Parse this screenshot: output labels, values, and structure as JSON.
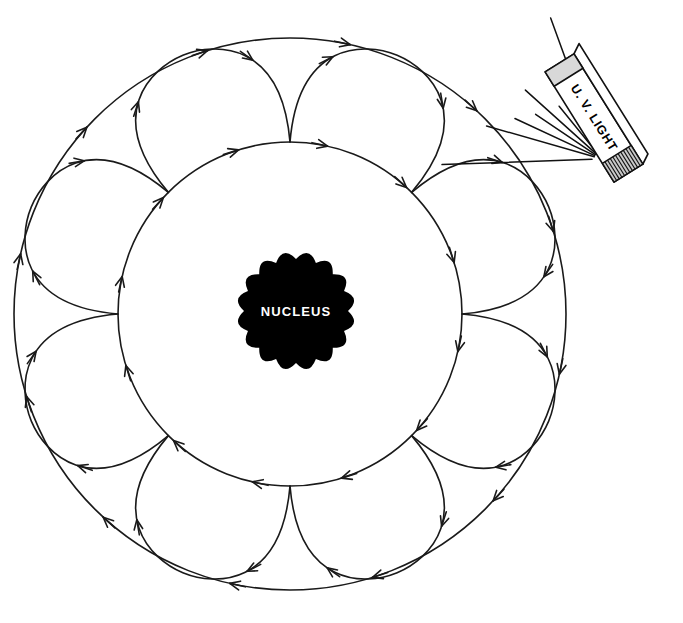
{
  "figure": {
    "background_color": "#ffffff",
    "line_color": "#1a1a1a",
    "width": 683,
    "height": 623
  },
  "nucleus": {
    "label": "NUCLEUS",
    "fill_color": "#000000",
    "text_color": "#ffffff",
    "center_x": 296,
    "center_y": 311,
    "radius": 52,
    "scallop_count": 16,
    "scallop_bump": 8
  },
  "orbits": {
    "center_x": 290,
    "center_y": 314,
    "inner": {
      "name": "inner-electron-shell",
      "radius": 172,
      "arrow_count": 12,
      "direction": "clockwise"
    },
    "outer": {
      "name": "outer-electron-shell",
      "radius": 276,
      "arrow_count": 12,
      "direction": "clockwise"
    },
    "petals": {
      "name": "excitation-transition-petals",
      "count": 8,
      "bulge": 62,
      "arrow_count_per_petal": 2
    }
  },
  "uv_lamp": {
    "label": "U. V. LIGHT",
    "angle_degrees": 58,
    "center_x": 594,
    "center_y": 118,
    "body_length": 130,
    "body_width": 34,
    "cap_color": "#d8d8d8",
    "grill_color": "#c9c9c9",
    "grill_line_count": 11,
    "ray_count": 9
  },
  "legend": {
    "description": "Electrons orbiting a nucleus absorb ultraviolet light and jump between the inner and outer shells along looping petal paths."
  }
}
